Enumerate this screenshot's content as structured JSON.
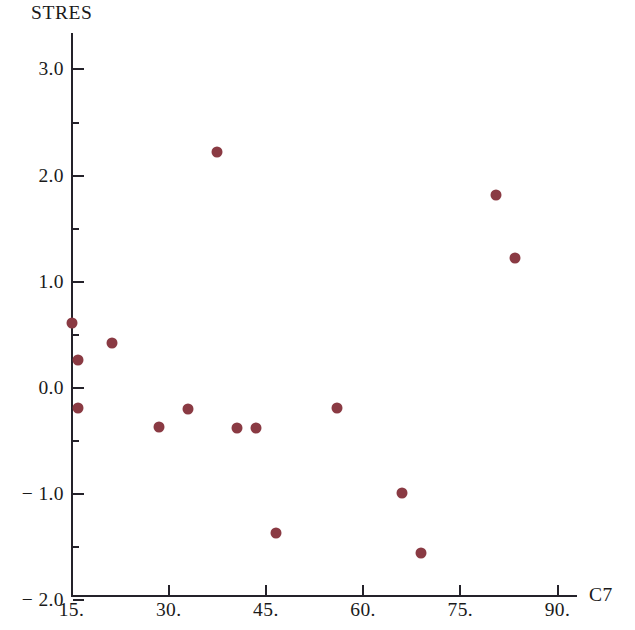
{
  "chart_data": {
    "type": "scatter",
    "title": "",
    "subtitle": "",
    "xlabel": "C7",
    "ylabel": "STRES",
    "xlim": [
      15,
      93
    ],
    "ylim": [
      -2.0,
      3.2
    ],
    "grid": false,
    "legend": null,
    "marker_color": "#8a3a43",
    "axis_color": "#24222a",
    "background_color": "#ffffff",
    "x_ticks": [
      {
        "value": 15,
        "label": "15."
      },
      {
        "value": 30,
        "label": "30."
      },
      {
        "value": 45,
        "label": "45."
      },
      {
        "value": 60,
        "label": "60."
      },
      {
        "value": 75,
        "label": "75."
      },
      {
        "value": 90,
        "label": "90."
      }
    ],
    "y_ticks": [
      {
        "value": 3.0,
        "label": "3.0"
      },
      {
        "value": 2.0,
        "label": "2.0"
      },
      {
        "value": 1.0,
        "label": "1.0"
      },
      {
        "value": 0.0,
        "label": "0.0"
      },
      {
        "value": -1.0,
        "label": "− 1.0"
      },
      {
        "value": -2.0,
        "label": "− 2.0"
      }
    ],
    "y_minor_ticks": [
      2.5,
      1.5,
      0.5,
      -0.5,
      -1.5
    ],
    "points": [
      {
        "x": 15.0,
        "y": 0.61
      },
      {
        "x": 16.0,
        "y": 0.26
      },
      {
        "x": 16.0,
        "y": -0.19
      },
      {
        "x": 21.3,
        "y": 0.42
      },
      {
        "x": 28.5,
        "y": -0.37
      },
      {
        "x": 33.0,
        "y": -0.2
      },
      {
        "x": 37.5,
        "y": 2.22
      },
      {
        "x": 40.5,
        "y": -0.38
      },
      {
        "x": 43.5,
        "y": -0.38
      },
      {
        "x": 46.5,
        "y": -1.37
      },
      {
        "x": 56.0,
        "y": -0.19
      },
      {
        "x": 66.0,
        "y": -0.99
      },
      {
        "x": 69.0,
        "y": -1.55
      },
      {
        "x": 80.5,
        "y": 1.82
      },
      {
        "x": 83.5,
        "y": 1.22
      }
    ]
  }
}
